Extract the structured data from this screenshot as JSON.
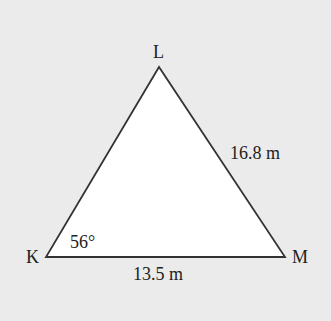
{
  "figure": {
    "type": "triangle",
    "vertices": [
      {
        "name": "L",
        "x": 159,
        "y": 67
      },
      {
        "name": "K",
        "x": 46,
        "y": 257
      },
      {
        "name": "M",
        "x": 285,
        "y": 257
      }
    ],
    "labels": {
      "L": "L",
      "K": "K",
      "M": "M",
      "angle_K": "56°",
      "side_LM": "16.8 m",
      "side_KM": "13.5 m"
    },
    "colors": {
      "background": "#ebebeb",
      "fill": "#ffffff",
      "stroke": "#333333"
    }
  }
}
